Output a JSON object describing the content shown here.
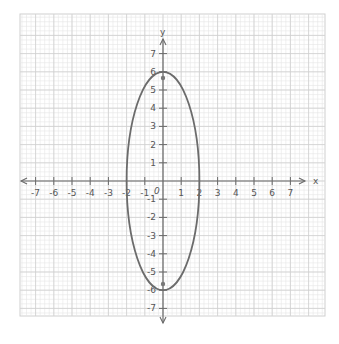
{
  "graph": {
    "x_axis_label": "x",
    "y_axis_label": "y",
    "origin_label": "0",
    "x_ticks": [
      "-7",
      "-6",
      "-5",
      "-4",
      "-3",
      "-2",
      "-1",
      "1",
      "2",
      "3",
      "4",
      "5",
      "6",
      "7"
    ],
    "y_ticks": [
      "7",
      "6",
      "5",
      "4",
      "3",
      "2",
      "1",
      "-1",
      "-2",
      "-3",
      "-4",
      "-5",
      "-6",
      "-7"
    ],
    "x_range": [
      -7.5,
      7.5
    ],
    "y_range": [
      -7.5,
      7.5
    ],
    "curve": {
      "type": "ellipse",
      "center": [
        0,
        0
      ],
      "semi_axis_x": 2,
      "semi_axis_y": 6,
      "color": "#6b6b6b"
    },
    "points": [
      {
        "name": "focus-top",
        "x": 0,
        "y": 5.66
      },
      {
        "name": "focus-bottom",
        "x": 0,
        "y": -5.66
      }
    ],
    "colors": {
      "grid_minor": "#e6e6e6",
      "grid_major": "#cfcfcf",
      "axis": "#6a6a6a",
      "label": "#555555"
    }
  }
}
